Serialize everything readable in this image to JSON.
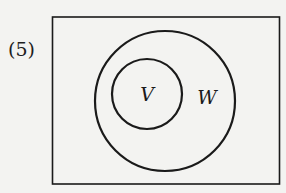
{
  "problem": {
    "number_label": "(5)"
  },
  "diagram": {
    "type": "venn",
    "universe": {
      "shape": "rectangle",
      "x": 52,
      "y": 17,
      "width": 227,
      "height": 167
    },
    "sets": [
      {
        "name": "W",
        "label": "W",
        "cx": 165,
        "cy": 101,
        "r": 70,
        "label_x": 207,
        "label_y": 104
      },
      {
        "name": "V",
        "label": "V",
        "cx": 147,
        "cy": 94,
        "r": 35,
        "label_x": 147,
        "label_y": 101
      }
    ],
    "relationship": "V is a subset of W",
    "stroke_color": "#1a1a1a",
    "background_color": "#f3f3f1"
  }
}
